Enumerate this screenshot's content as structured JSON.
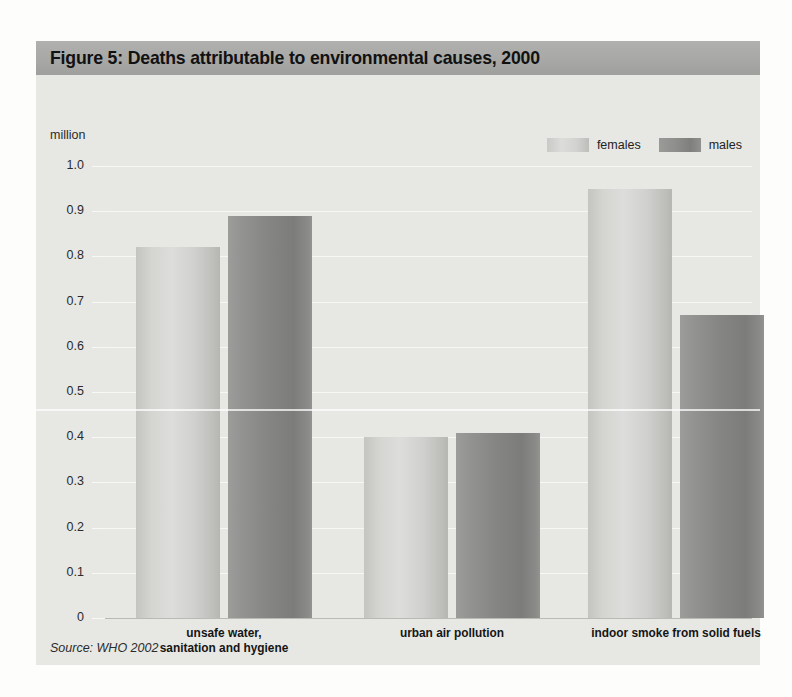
{
  "figure": {
    "title": "Figure 5: Deaths attributable to environmental causes, 2000",
    "source": "Source: WHO 2002",
    "unit_label": "million"
  },
  "legend": {
    "position": "top-right",
    "entries": [
      {
        "label": "females",
        "color": "#d4d4d1"
      },
      {
        "label": "males",
        "color": "#8a8a89"
      }
    ]
  },
  "colors": {
    "panel_background": "#e7e7e4",
    "title_band": "#a9a9a7",
    "gridline": "#f7f7f5",
    "baseline": "#b9b9b6",
    "females_bar": "#d4d4d1",
    "males_bar": "#8a8a89",
    "text": "#1a1a1a"
  },
  "axes": {
    "y_tick_labels": [
      "1.0",
      "0.9",
      "0.8",
      "0.7",
      "0.6",
      "0.5",
      "0.4",
      "0.3",
      "0.2",
      "0.1",
      "0"
    ],
    "y_min": 0,
    "y_max": 1.0,
    "y_step": 0.1
  },
  "chart_data": {
    "type": "bar",
    "title": "Figure 5: Deaths attributable to environmental causes, 2000",
    "subtitle": "",
    "xlabel": "",
    "ylabel": "million",
    "ylim": [
      0,
      1.0
    ],
    "ytick_step": 0.1,
    "grid": true,
    "legend_position": "top-right",
    "categories": [
      "unsafe water, sanitation and hygiene",
      "urban air pollution",
      "indoor smoke from solid fuels"
    ],
    "category_label_lines": [
      [
        "unsafe water,",
        "sanitation and hygiene"
      ],
      [
        "urban air pollution"
      ],
      [
        "indoor smoke from solid fuels"
      ]
    ],
    "series": [
      {
        "name": "females",
        "values": [
          0.82,
          0.4,
          0.95
        ]
      },
      {
        "name": "males",
        "values": [
          0.89,
          0.41,
          0.67
        ]
      }
    ],
    "units": "million deaths",
    "source": "Source: WHO 2002"
  }
}
